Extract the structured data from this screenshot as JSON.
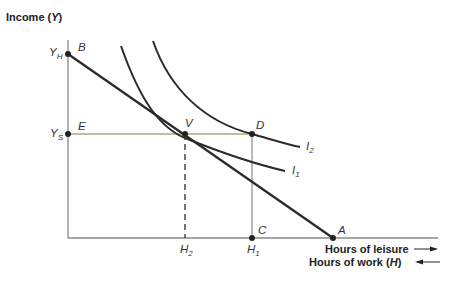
{
  "diagram": {
    "y_axis_label": "Income",
    "y_axis_symbol": "Y",
    "x_axis_label_1": "Hours of leisure",
    "x_axis_label_2": "Hours of work",
    "x_axis_symbol": "H",
    "points": {
      "B": "B",
      "E": "E",
      "V": "V",
      "D": "D",
      "C": "C",
      "A": "A"
    },
    "y_ticks": [
      {
        "main": "Y",
        "sub": "H"
      },
      {
        "main": "Y",
        "sub": "S"
      }
    ],
    "x_ticks": [
      {
        "main": "H",
        "sub": "2"
      },
      {
        "main": "H",
        "sub": "1"
      }
    ],
    "curves": [
      {
        "main": "I",
        "sub": "2"
      },
      {
        "main": "I",
        "sub": "1"
      }
    ],
    "colors": {
      "line": "#2b2b2b",
      "axis": "#8a8a8a",
      "subsidy_line": "#a7ad7a"
    }
  }
}
